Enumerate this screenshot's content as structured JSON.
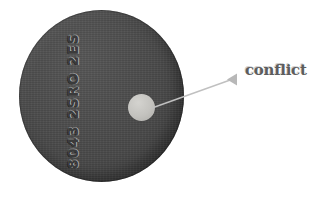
{
  "image": {
    "title": "Annotated disc with conflict callout",
    "background_color": "#ffffff",
    "width": 309,
    "height": 197
  },
  "disc": {
    "name": "dark gray circular disc",
    "fill_color": "#4a4a4a",
    "edge_color": "#3d3d3d",
    "engraving": {
      "text": "8043 2SRO 2ES",
      "orientation": "vertical",
      "color": "#3a3a3a"
    }
  },
  "spot": {
    "name": "light gray circular spot",
    "fill_color": "#c3c2be"
  },
  "annotation": {
    "label": "conflict",
    "label_color": "#5d5d5d",
    "leader_line_color": "#c0c0c0",
    "arrowhead_color": "#b8b8b8",
    "points_to": "spot"
  }
}
